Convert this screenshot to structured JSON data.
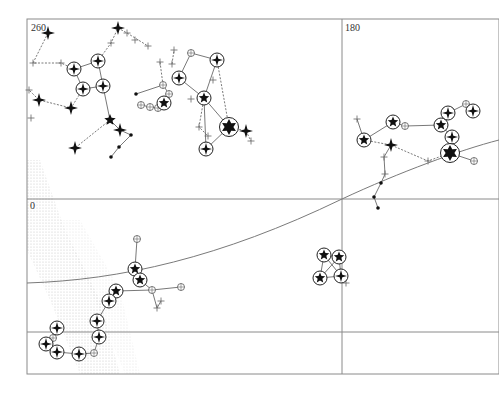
{
  "map": {
    "title": "Star chart",
    "labels": [
      {
        "text": "260",
        "x": 31,
        "y": 30
      },
      {
        "text": "180",
        "x": 345,
        "y": 30
      },
      {
        "text": "0",
        "x": 30,
        "y": 208
      }
    ],
    "frame": {
      "x": 27,
      "y": 19,
      "width": 472,
      "height": 355
    },
    "grid": {
      "vertical": [
        342
      ],
      "horizontal": [
        199,
        332
      ]
    },
    "ecliptic": "M27,283 C120,280 220,258 342,199 C400,172 460,150 499,140",
    "colors": {
      "ink": "#111111",
      "grid": "#8a8a8a",
      "milky_way": "#c8c8c8"
    },
    "stars": [
      {
        "x": 48,
        "y": 33,
        "type": "sparkle"
      },
      {
        "x": 118,
        "y": 28,
        "type": "sparkle"
      },
      {
        "x": 74,
        "y": 69,
        "type": "ring-sparkle"
      },
      {
        "x": 98,
        "y": 61,
        "type": "ring-sparkle"
      },
      {
        "x": 83,
        "y": 89,
        "type": "ring-sparkle"
      },
      {
        "x": 103,
        "y": 86,
        "type": "ring-sparkle"
      },
      {
        "x": 39,
        "y": 100,
        "type": "sparkle"
      },
      {
        "x": 71,
        "y": 108,
        "type": "sparkle"
      },
      {
        "x": 110,
        "y": 120,
        "type": "star"
      },
      {
        "x": 120,
        "y": 130,
        "type": "sparkle"
      },
      {
        "x": 75,
        "y": 148,
        "type": "sparkle"
      },
      {
        "x": 179,
        "y": 78,
        "type": "ring-sparkle"
      },
      {
        "x": 217,
        "y": 60,
        "type": "ring-sparkle"
      },
      {
        "x": 204,
        "y": 98,
        "type": "ring-star"
      },
      {
        "x": 164,
        "y": 103,
        "type": "ring-star"
      },
      {
        "x": 229,
        "y": 127,
        "type": "ring-big"
      },
      {
        "x": 206,
        "y": 149,
        "type": "ring-sparkle"
      },
      {
        "x": 246,
        "y": 131,
        "type": "sparkle"
      },
      {
        "x": 364,
        "y": 140,
        "type": "ring-star"
      },
      {
        "x": 393,
        "y": 122,
        "type": "ring-star"
      },
      {
        "x": 441,
        "y": 125,
        "type": "ring-star"
      },
      {
        "x": 448,
        "y": 113,
        "type": "ring-sparkle"
      },
      {
        "x": 473,
        "y": 111,
        "type": "ring-sparkle"
      },
      {
        "x": 452,
        "y": 137,
        "type": "ring-sparkle"
      },
      {
        "x": 391,
        "y": 145,
        "type": "sparkle"
      },
      {
        "x": 450,
        "y": 153,
        "type": "ring-big"
      },
      {
        "x": 135,
        "y": 269,
        "type": "ring-star"
      },
      {
        "x": 140,
        "y": 280,
        "type": "ring-star"
      },
      {
        "x": 116,
        "y": 291,
        "type": "ring-star"
      },
      {
        "x": 109,
        "y": 301,
        "type": "ring-sparkle"
      },
      {
        "x": 97,
        "y": 321,
        "type": "ring-sparkle"
      },
      {
        "x": 99,
        "y": 337,
        "type": "ring-sparkle"
      },
      {
        "x": 57,
        "y": 328,
        "type": "ring-sparkle"
      },
      {
        "x": 46,
        "y": 344,
        "type": "ring-sparkle"
      },
      {
        "x": 57,
        "y": 352,
        "type": "ring-sparkle"
      },
      {
        "x": 79,
        "y": 354,
        "type": "ring-sparkle"
      },
      {
        "x": 324,
        "y": 255,
        "type": "ring-star"
      },
      {
        "x": 339,
        "y": 257,
        "type": "ring-star"
      },
      {
        "x": 320,
        "y": 278,
        "type": "ring-star"
      },
      {
        "x": 341,
        "y": 276,
        "type": "ring-sparkle"
      }
    ],
    "small_stars": [
      {
        "x": 135,
        "y": 40,
        "type": "cross"
      },
      {
        "x": 127,
        "y": 33,
        "type": "cross"
      },
      {
        "x": 148,
        "y": 46,
        "type": "cross"
      },
      {
        "x": 33,
        "y": 63,
        "type": "cross"
      },
      {
        "x": 61,
        "y": 63,
        "type": "cross"
      },
      {
        "x": 111,
        "y": 43,
        "type": "cross"
      },
      {
        "x": 29,
        "y": 90,
        "type": "cross"
      },
      {
        "x": 31,
        "y": 118,
        "type": "cross"
      },
      {
        "x": 174,
        "y": 50,
        "type": "cross"
      },
      {
        "x": 172,
        "y": 64,
        "type": "cross"
      },
      {
        "x": 160,
        "y": 62,
        "type": "cross"
      },
      {
        "x": 191,
        "y": 53,
        "type": "circle"
      },
      {
        "x": 163,
        "y": 85,
        "type": "circle"
      },
      {
        "x": 169,
        "y": 94,
        "type": "circle"
      },
      {
        "x": 141,
        "y": 105,
        "type": "circle"
      },
      {
        "x": 150,
        "y": 107,
        "type": "circle"
      },
      {
        "x": 158,
        "y": 108,
        "type": "circle"
      },
      {
        "x": 136,
        "y": 94,
        "type": "dot"
      },
      {
        "x": 191,
        "y": 99,
        "type": "cross"
      },
      {
        "x": 199,
        "y": 127,
        "type": "cross"
      },
      {
        "x": 208,
        "y": 136,
        "type": "cross"
      },
      {
        "x": 213,
        "y": 80,
        "type": "cross"
      },
      {
        "x": 251,
        "y": 141,
        "type": "cross"
      },
      {
        "x": 131,
        "y": 135,
        "type": "dot"
      },
      {
        "x": 119,
        "y": 147,
        "type": "dot"
      },
      {
        "x": 111,
        "y": 157,
        "type": "dot"
      },
      {
        "x": 357,
        "y": 119,
        "type": "cross"
      },
      {
        "x": 405,
        "y": 126,
        "type": "circle"
      },
      {
        "x": 466,
        "y": 104,
        "type": "circle"
      },
      {
        "x": 474,
        "y": 161,
        "type": "circle"
      },
      {
        "x": 428,
        "y": 161,
        "type": "cross"
      },
      {
        "x": 384,
        "y": 157,
        "type": "cross"
      },
      {
        "x": 385,
        "y": 174,
        "type": "cross"
      },
      {
        "x": 381,
        "y": 183,
        "type": "dot"
      },
      {
        "x": 374,
        "y": 197,
        "type": "dot"
      },
      {
        "x": 378,
        "y": 208,
        "type": "dot"
      },
      {
        "x": 137,
        "y": 239,
        "type": "circle"
      },
      {
        "x": 152,
        "y": 290,
        "type": "circle"
      },
      {
        "x": 181,
        "y": 287,
        "type": "circle"
      },
      {
        "x": 157,
        "y": 308,
        "type": "cross"
      },
      {
        "x": 161,
        "y": 301,
        "type": "cross"
      },
      {
        "x": 53,
        "y": 338,
        "type": "circle"
      },
      {
        "x": 94,
        "y": 353,
        "type": "circle"
      },
      {
        "x": 346,
        "y": 283,
        "type": "cross"
      }
    ],
    "lines": [
      {
        "pts": [
          [
            48,
            33
          ],
          [
            33,
            63
          ],
          [
            61,
            63
          ],
          [
            74,
            69
          ]
        ],
        "style": "dash"
      },
      {
        "pts": [
          [
            74,
            69
          ],
          [
            98,
            61
          ],
          [
            103,
            86
          ],
          [
            83,
            89
          ],
          [
            74,
            69
          ]
        ],
        "style": "solid"
      },
      {
        "pts": [
          [
            98,
            61
          ],
          [
            111,
            43
          ],
          [
            118,
            28
          ]
        ],
        "style": "dash"
      },
      {
        "pts": [
          [
            118,
            28
          ],
          [
            127,
            33
          ],
          [
            148,
            46
          ]
        ],
        "style": "dash"
      },
      {
        "pts": [
          [
            83,
            89
          ],
          [
            71,
            108
          ],
          [
            39,
            100
          ],
          [
            29,
            90
          ]
        ],
        "style": "dash"
      },
      {
        "pts": [
          [
            103,
            86
          ],
          [
            110,
            120
          ],
          [
            120,
            130
          ],
          [
            131,
            135
          ],
          [
            119,
            147
          ],
          [
            111,
            157
          ]
        ],
        "style": "solid"
      },
      {
        "pts": [
          [
            110,
            120
          ],
          [
            75,
            148
          ]
        ],
        "style": "dash"
      },
      {
        "pts": [
          [
            136,
            94
          ],
          [
            163,
            85
          ],
          [
            169,
            94
          ],
          [
            164,
            103
          ],
          [
            158,
            108
          ],
          [
            150,
            107
          ],
          [
            141,
            105
          ]
        ],
        "style": "solid"
      },
      {
        "pts": [
          [
            163,
            85
          ],
          [
            160,
            62
          ]
        ],
        "style": "dash"
      },
      {
        "pts": [
          [
            179,
            78
          ],
          [
            191,
            53
          ],
          [
            217,
            60
          ],
          [
            204,
            98
          ],
          [
            179,
            78
          ]
        ],
        "style": "solid"
      },
      {
        "pts": [
          [
            204,
            98
          ],
          [
            229,
            127
          ],
          [
            206,
            149
          ],
          [
            204,
            98
          ]
        ],
        "style": "solid"
      },
      {
        "pts": [
          [
            217,
            60
          ],
          [
            229,
            127
          ]
        ],
        "style": "dash"
      },
      {
        "pts": [
          [
            204,
            98
          ],
          [
            199,
            127
          ],
          [
            208,
            136
          ]
        ],
        "style": "dash"
      },
      {
        "pts": [
          [
            229,
            127
          ],
          [
            246,
            131
          ],
          [
            251,
            141
          ]
        ],
        "style": "dash"
      },
      {
        "pts": [
          [
            172,
            64
          ],
          [
            174,
            50
          ]
        ],
        "style": "dash"
      },
      {
        "pts": [
          [
            357,
            119
          ],
          [
            364,
            140
          ],
          [
            393,
            122
          ],
          [
            405,
            126
          ],
          [
            441,
            125
          ],
          [
            448,
            113
          ],
          [
            466,
            104
          ],
          [
            473,
            111
          ]
        ],
        "style": "solid"
      },
      {
        "pts": [
          [
            441,
            125
          ],
          [
            452,
            137
          ],
          [
            450,
            153
          ],
          [
            474,
            161
          ]
        ],
        "style": "solid"
      },
      {
        "pts": [
          [
            364,
            140
          ],
          [
            391,
            145
          ],
          [
            428,
            161
          ],
          [
            450,
            153
          ]
        ],
        "style": "dash"
      },
      {
        "pts": [
          [
            391,
            145
          ],
          [
            384,
            157
          ],
          [
            385,
            174
          ],
          [
            381,
            183
          ],
          [
            374,
            197
          ],
          [
            378,
            208
          ]
        ],
        "style": "solid"
      },
      {
        "pts": [
          [
            137,
            239
          ],
          [
            135,
            269
          ],
          [
            140,
            280
          ],
          [
            152,
            290
          ],
          [
            181,
            287
          ]
        ],
        "style": "solid"
      },
      {
        "pts": [
          [
            152,
            290
          ],
          [
            157,
            308
          ],
          [
            161,
            301
          ]
        ],
        "style": "solid"
      },
      {
        "pts": [
          [
            152,
            290
          ],
          [
            116,
            291
          ],
          [
            109,
            301
          ],
          [
            97,
            321
          ],
          [
            99,
            337
          ],
          [
            94,
            353
          ],
          [
            79,
            354
          ],
          [
            57,
            352
          ],
          [
            46,
            344
          ],
          [
            53,
            338
          ],
          [
            57,
            328
          ]
        ],
        "style": "solid"
      },
      {
        "pts": [
          [
            324,
            255
          ],
          [
            339,
            257
          ],
          [
            341,
            276
          ],
          [
            320,
            278
          ],
          [
            324,
            255
          ],
          [
            341,
            276
          ]
        ],
        "style": "solid"
      },
      {
        "pts": [
          [
            339,
            257
          ],
          [
            320,
            278
          ]
        ],
        "style": "solid"
      }
    ]
  }
}
